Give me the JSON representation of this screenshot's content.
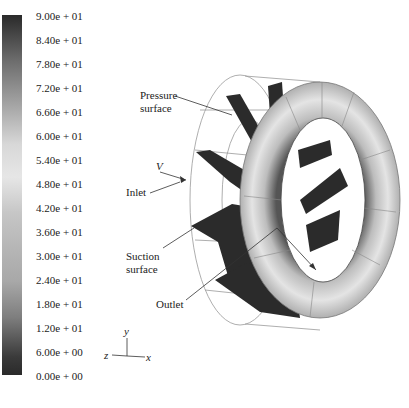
{
  "colorbar": {
    "ticks": [
      "9.00e + 01",
      "8.40e + 01",
      "7.80e + 01",
      "7.20e + 01",
      "6.60e + 01",
      "6.00e + 01",
      "5.40e + 01",
      "4.80e + 01",
      "4.20e + 01",
      "3.60e + 01",
      "3.00e + 01",
      "2.40e + 01",
      "1.80e + 01",
      "1.20e + 01",
      "6.00e + 00",
      "0.00e + 00"
    ]
  },
  "labels": {
    "pressure_1": "Pressure",
    "pressure_2": "surface",
    "v": "V",
    "inlet": "Inlet",
    "suction_1": "Suction",
    "suction_2": "surface",
    "outlet": "Outlet"
  },
  "axes": {
    "y": "y",
    "z": "z",
    "x": "x"
  }
}
